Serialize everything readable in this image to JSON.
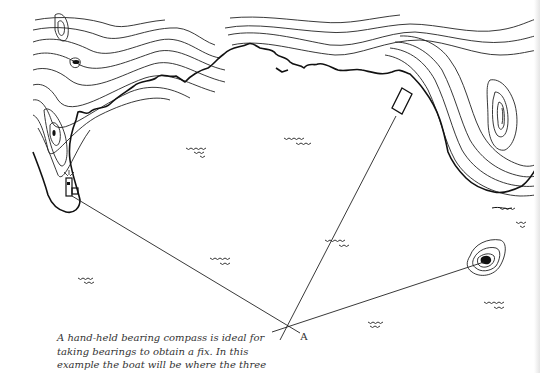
{
  "figure": {
    "position_label": "A",
    "caption_lines": [
      "A hand-held bearing compass is ideal for",
      "taking bearings to obtain a fix. In this",
      "example the boat will be where the three"
    ]
  },
  "landmarks": [
    {
      "name": "lighthouse-building",
      "x": 70,
      "y": 192
    },
    {
      "name": "headland-hut",
      "x": 405,
      "y": 102
    },
    {
      "name": "rock-islet",
      "x": 486,
      "y": 262
    }
  ],
  "fix_point": {
    "x": 287,
    "y": 327
  },
  "colors": {
    "ink": "#222222",
    "paper": "#ffffff"
  }
}
